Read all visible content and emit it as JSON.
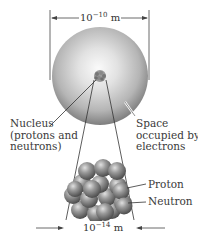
{
  "diagram": {
    "atom_scale": {
      "base": "10",
      "exponent": "−10",
      "unit": "m"
    },
    "nucleus_scale": {
      "base": "10",
      "exponent": "−14",
      "unit": "m"
    },
    "labels": {
      "nucleus": [
        "Nucleus",
        "(protons and",
        "neutrons)"
      ],
      "electron_space": [
        "Space",
        "occupied by",
        "electrons"
      ],
      "proton": "Proton",
      "neutron": "Neutron"
    },
    "colors": {
      "electron_cloud_center": "#f4f4f4",
      "electron_cloud_edge": "#8a8a8a",
      "particle_dark": "#4a4a4a",
      "particle_light": "#cfcfcf",
      "line": "#333333"
    }
  }
}
